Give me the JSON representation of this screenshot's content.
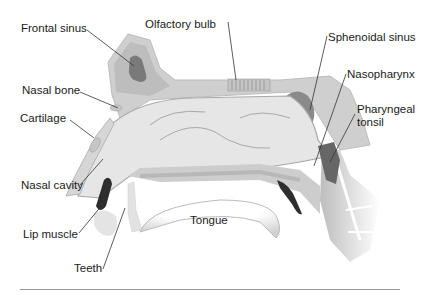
{
  "diagram": {
    "labels": {
      "frontal_sinus": "Frontal sinus",
      "olfactory_bulb": "Olfactory bulb",
      "sphenoidal_sinus": "Sphenoidal sinus",
      "nasal_bone": "Nasal bone",
      "nasopharynx": "Nasopharynx",
      "cartilage": "Cartilage",
      "pharyngeal_tonsil_line1": "Pharyngeal",
      "pharyngeal_tonsil_line2": "tonsil",
      "nasal_cavity": "Nasal cavity",
      "tongue": "Tongue",
      "lip_muscle": "Lip muscle",
      "teeth": "Teeth"
    },
    "colors": {
      "bone_light": "#d9d9d9",
      "tissue_mid": "#bdbdbd",
      "sinus_dark": "#7a7a7a",
      "muscle_dark": "#2e2e2e",
      "cavity_fill": "#e6e6e6",
      "line": "#333333"
    }
  }
}
